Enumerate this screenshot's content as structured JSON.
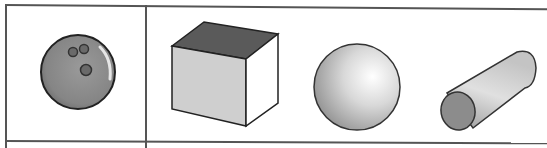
{
  "table": {
    "rows": [
      {
        "cells": [
          {
            "items": [
              {
                "shape": "bowling-ball",
                "label": ""
              }
            ]
          },
          {
            "items": [
              {
                "shape": "cube",
                "label": ""
              },
              {
                "shape": "sphere",
                "label": ""
              },
              {
                "shape": "cylinder",
                "label": ""
              }
            ]
          }
        ]
      }
    ]
  },
  "colors": {
    "border": "#555555",
    "ball": "#8a8a8a",
    "ball_holes": "#6a6a6a",
    "cube_top": "#5a5a5a",
    "cube_front": "#cfcfcf",
    "cube_side": "#ffffff",
    "sphere_light": "#ffffff",
    "sphere_dark": "#9a9a9a",
    "cylinder_end": "#8c8c8c"
  }
}
